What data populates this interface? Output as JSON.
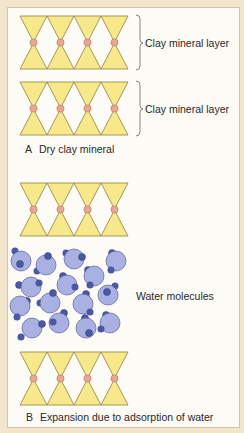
{
  "diagram": {
    "panel_a": {
      "letter": "A",
      "caption": "Dry clay mineral",
      "layers": [
        {
          "label": "Clay mineral layer"
        },
        {
          "label": "Clay mineral layer"
        }
      ]
    },
    "panel_b": {
      "letter": "B",
      "caption": "Expansion due to adsorption of water",
      "water_label": "Water molecules"
    },
    "colors": {
      "background": "#f2e5cc",
      "frame": "#fdfbf5",
      "tetrahedron_fill": "#f7e98a",
      "tetrahedron_stroke": "#8f8240",
      "cation_fill": "#eca58e",
      "cation_stroke": "#b7735c",
      "water_oxygen_fill": "#a9b1e2",
      "water_oxygen_stroke": "#5a609c",
      "water_hydrogen_fill": "#4a58a6"
    }
  }
}
